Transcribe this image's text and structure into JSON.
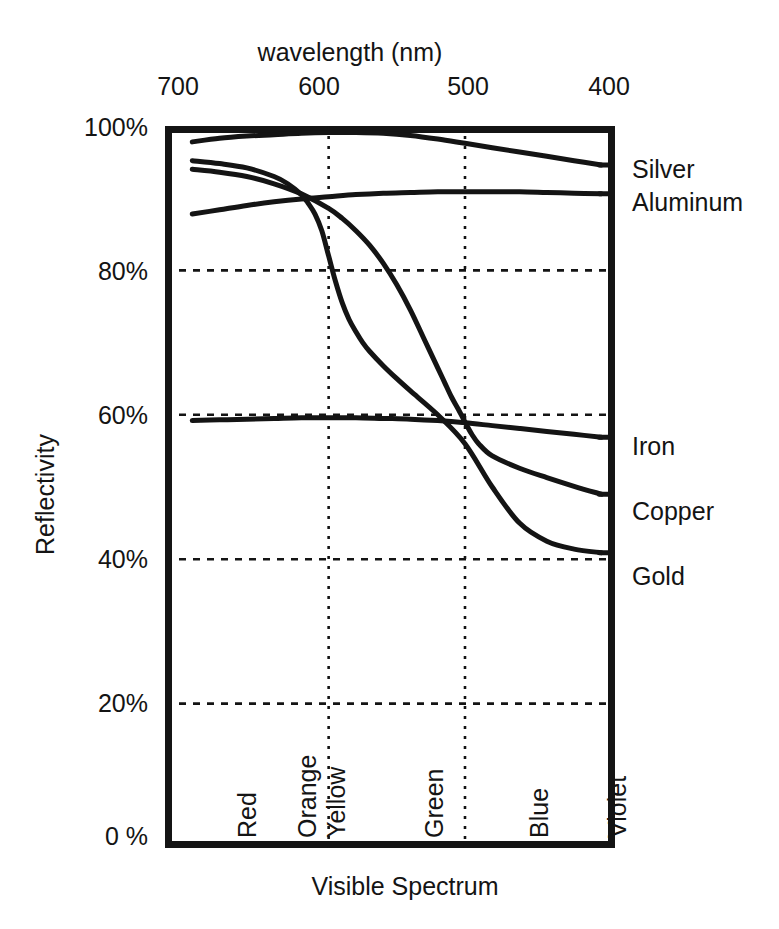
{
  "chart_data": {
    "type": "line",
    "title": "wavelength (nm)",
    "subtitle": "",
    "xlabel": "Visible Spectrum",
    "ylabel": "Reflectivity",
    "x_axis_position": "top",
    "x_axis_title": "wavelength (nm)",
    "x_tick_labels": [
      "700",
      "600",
      "500",
      "400"
    ],
    "x_tick_values": [
      700,
      600,
      500,
      400
    ],
    "xlim": [
      720,
      390
    ],
    "x_direction": "decreasing",
    "y_tick_labels": [
      "100%",
      "80%",
      "60%",
      "40%",
      "20%",
      "0 %"
    ],
    "y_tick_values": [
      100,
      80,
      60,
      40,
      20,
      0
    ],
    "ylim": [
      0,
      100
    ],
    "grid": "dotted-major-both",
    "legend_position": "right-of-axes (direct line labels)",
    "spectrum_bands": [
      {
        "label": "Red",
        "x_nm": 660
      },
      {
        "label": "Orange",
        "x_nm": 620
      },
      {
        "label": "Yellow",
        "x_nm": 601
      },
      {
        "label": "Green",
        "x_nm": 540
      },
      {
        "label": "Blue",
        "x_nm": 470
      },
      {
        "label": "Violet",
        "x_nm": 405
      }
    ],
    "gridlines_vertical_nm": [
      600,
      500
    ],
    "gridlines_horizontal_pct": [
      80,
      60,
      40,
      20
    ],
    "series": [
      {
        "name": "Silver",
        "label": "Silver",
        "label_y_pct": 95,
        "x": [
          700,
          680,
          660,
          640,
          620,
          600,
          580,
          560,
          540,
          520,
          500,
          480,
          460,
          440,
          420,
          400
        ],
        "values": [
          97.8,
          98.3,
          98.6,
          98.8,
          99.0,
          99.1,
          99.1,
          99.0,
          98.7,
          98.2,
          97.6,
          97.0,
          96.4,
          95.8,
          95.2,
          94.6
        ]
      },
      {
        "name": "Aluminum",
        "label": "Aluminum",
        "label_y_pct": 90,
        "x": [
          700,
          680,
          660,
          640,
          620,
          600,
          580,
          560,
          540,
          520,
          500,
          480,
          460,
          440,
          420,
          400
        ],
        "values": [
          87.8,
          88.4,
          89.0,
          89.5,
          89.9,
          90.2,
          90.5,
          90.7,
          90.8,
          90.9,
          90.9,
          90.9,
          90.9,
          90.8,
          90.7,
          90.6
        ]
      },
      {
        "name": "Iron",
        "label": "Iron",
        "label_y_pct": 57.5,
        "x": [
          700,
          680,
          660,
          640,
          620,
          600,
          580,
          560,
          540,
          520,
          500,
          480,
          460,
          440,
          420,
          400
        ],
        "values": [
          59.2,
          59.3,
          59.4,
          59.5,
          59.6,
          59.6,
          59.6,
          59.5,
          59.4,
          59.2,
          58.9,
          58.5,
          58.1,
          57.7,
          57.3,
          56.9
        ]
      },
      {
        "name": "Copper",
        "label": "Copper",
        "label_y_pct": 48,
        "x": [
          700,
          680,
          660,
          640,
          620,
          600,
          590,
          580,
          570,
          560,
          550,
          540,
          530,
          520,
          515,
          510,
          505,
          500,
          495,
          490,
          480,
          460,
          440,
          420,
          400
        ],
        "values": [
          94.0,
          93.6,
          93.0,
          92.0,
          90.6,
          88.6,
          87.2,
          85.5,
          83.5,
          81.0,
          78.0,
          74.5,
          70.5,
          66.5,
          64.5,
          62.5,
          60.8,
          59.0,
          57.3,
          56.0,
          54.3,
          52.6,
          51.3,
          50.1,
          49.0
        ]
      },
      {
        "name": "Gold",
        "label": "Gold",
        "label_y_pct": 40,
        "x": [
          700,
          680,
          660,
          640,
          630,
          620,
          615,
          610,
          605,
          600,
          595,
          590,
          585,
          580,
          575,
          570,
          560,
          550,
          540,
          520,
          500,
          480,
          460,
          440,
          420,
          400
        ],
        "values": [
          95.2,
          94.8,
          94.2,
          93.0,
          92.0,
          90.5,
          89.3,
          87.8,
          85.5,
          82.0,
          78.5,
          75.5,
          73.2,
          71.5,
          70.0,
          68.8,
          66.8,
          65.0,
          63.3,
          60.0,
          56.0,
          50.0,
          45.0,
          42.5,
          41.4,
          40.9
        ]
      }
    ]
  },
  "colors": {
    "ink": "#141414",
    "background": "#ffffff",
    "grid": "#1a1a1a"
  }
}
